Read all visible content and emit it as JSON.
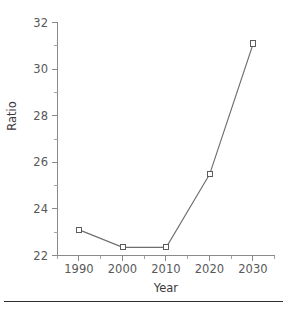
{
  "chart_data": {
    "type": "line",
    "title": "",
    "xlabel": "Year",
    "ylabel": "Ratio",
    "x": [
      1990,
      2000,
      2010,
      2020,
      2030
    ],
    "categories": [
      "1990",
      "2000",
      "2010",
      "2020",
      "2030"
    ],
    "values": [
      23.1,
      22.35,
      22.35,
      25.5,
      31.1
    ],
    "series": [
      {
        "name": "Ratio",
        "values": [
          23.1,
          22.35,
          22.35,
          25.5,
          31.1
        ]
      }
    ],
    "xlim": [
      1985,
      2035
    ],
    "ylim": [
      22,
      32
    ],
    "y_ticks": [
      "22",
      "24",
      "26",
      "28",
      "30",
      "32"
    ],
    "y_tick_values": [
      22,
      24,
      26,
      28,
      30,
      32
    ],
    "y_minor_tick_values": [
      23,
      25,
      27,
      29,
      31
    ],
    "x_ticks": [
      "1990",
      "2000",
      "2010",
      "2020",
      "2030"
    ],
    "x_tick_values": [
      1990,
      2000,
      2010,
      2020,
      2030
    ],
    "x_minor_tick_values": [
      1985,
      1995,
      2005,
      2015,
      2025,
      2035
    ],
    "grid": false,
    "legend": false,
    "legend_position": "none",
    "marker": "open-square",
    "line_color": "#6e6e70",
    "marker_fill": "#ffffff",
    "marker_edge_color": "#5c5c5e",
    "axis_color": "#8a8a8c",
    "text_color": "#58585a",
    "background": "#ffffff"
  },
  "footer": {
    "rule_color": "#2e2e30"
  }
}
